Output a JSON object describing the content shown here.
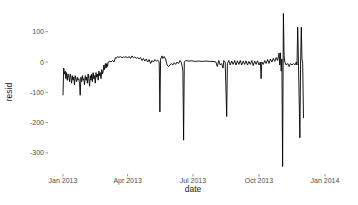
{
  "chart_data": {
    "type": "line",
    "title": "",
    "xlabel": "date",
    "ylabel": "resid",
    "ylim": [
      -350,
      170
    ],
    "xlim": [
      "2012-12-30",
      "2014-01-02"
    ],
    "grid": false,
    "legend": null,
    "x_ticks": [
      "Jan 2013",
      "Apr 2013",
      "Jul 2013",
      "Oct 2013",
      "Jan 2014"
    ],
    "y_ticks": [
      100,
      0,
      -100,
      -200,
      -300
    ],
    "line_color": "#000000",
    "series": [
      {
        "name": "resid",
        "points": [
          {
            "day": 1,
            "resid": -110
          },
          {
            "day": 2,
            "resid": -20
          },
          {
            "day": 3,
            "resid": -40
          },
          {
            "day": 4,
            "resid": -30
          },
          {
            "day": 5,
            "resid": -55
          },
          {
            "day": 6,
            "resid": -35
          },
          {
            "day": 7,
            "resid": -60
          },
          {
            "day": 8,
            "resid": -40
          },
          {
            "day": 9,
            "resid": -45
          },
          {
            "day": 10,
            "resid": -65
          },
          {
            "day": 11,
            "resid": -40
          },
          {
            "day": 12,
            "resid": -50
          },
          {
            "day": 13,
            "resid": -70
          },
          {
            "day": 14,
            "resid": -45
          },
          {
            "day": 15,
            "resid": -60
          },
          {
            "day": 16,
            "resid": -50
          },
          {
            "day": 17,
            "resid": -75
          },
          {
            "day": 18,
            "resid": -45
          },
          {
            "day": 19,
            "resid": -55
          },
          {
            "day": 20,
            "resid": -65
          },
          {
            "day": 21,
            "resid": -50
          },
          {
            "day": 22,
            "resid": -60
          },
          {
            "day": 23,
            "resid": -55
          },
          {
            "day": 24,
            "resid": -70
          },
          {
            "day": 25,
            "resid": -110
          },
          {
            "day": 26,
            "resid": -50
          },
          {
            "day": 27,
            "resid": -65
          },
          {
            "day": 28,
            "resid": -45
          },
          {
            "day": 29,
            "resid": -60
          },
          {
            "day": 30,
            "resid": -55
          },
          {
            "day": 31,
            "resid": -75
          },
          {
            "day": 32,
            "resid": -45
          },
          {
            "day": 33,
            "resid": -60
          },
          {
            "day": 34,
            "resid": -50
          },
          {
            "day": 35,
            "resid": -70
          },
          {
            "day": 36,
            "resid": -40
          },
          {
            "day": 37,
            "resid": -55
          },
          {
            "day": 38,
            "resid": -80
          },
          {
            "day": 39,
            "resid": -45
          },
          {
            "day": 40,
            "resid": -60
          },
          {
            "day": 41,
            "resid": -40
          },
          {
            "day": 42,
            "resid": -65
          },
          {
            "day": 43,
            "resid": -35
          },
          {
            "day": 44,
            "resid": -55
          },
          {
            "day": 45,
            "resid": -45
          },
          {
            "day": 46,
            "resid": -70
          },
          {
            "day": 47,
            "resid": -35
          },
          {
            "day": 48,
            "resid": -50
          },
          {
            "day": 49,
            "resid": -40
          },
          {
            "day": 50,
            "resid": -60
          },
          {
            "day": 51,
            "resid": -30
          },
          {
            "day": 52,
            "resid": -45
          },
          {
            "day": 53,
            "resid": -35
          },
          {
            "day": 54,
            "resid": -55
          },
          {
            "day": 55,
            "resid": -25
          },
          {
            "day": 56,
            "resid": -40
          },
          {
            "day": 57,
            "resid": -30
          },
          {
            "day": 58,
            "resid": -10
          },
          {
            "day": 59,
            "resid": -25
          },
          {
            "day": 60,
            "resid": -5
          },
          {
            "day": 61,
            "resid": -20
          },
          {
            "day": 62,
            "resid": -5
          },
          {
            "day": 63,
            "resid": -15
          },
          {
            "day": 64,
            "resid": 0
          },
          {
            "day": 66,
            "resid": 2
          },
          {
            "day": 68,
            "resid": 0
          },
          {
            "day": 70,
            "resid": 5
          },
          {
            "day": 72,
            "resid": 0
          },
          {
            "day": 74,
            "resid": 15
          },
          {
            "day": 75,
            "resid": 12
          },
          {
            "day": 77,
            "resid": 18
          },
          {
            "day": 79,
            "resid": 15
          },
          {
            "day": 81,
            "resid": 18
          },
          {
            "day": 83,
            "resid": 14
          },
          {
            "day": 85,
            "resid": 17
          },
          {
            "day": 87,
            "resid": 15
          },
          {
            "day": 89,
            "resid": 18
          },
          {
            "day": 91,
            "resid": 13
          },
          {
            "day": 93,
            "resid": 18
          },
          {
            "day": 95,
            "resid": 12
          },
          {
            "day": 97,
            "resid": 20
          },
          {
            "day": 99,
            "resid": 14
          },
          {
            "day": 101,
            "resid": 17
          },
          {
            "day": 103,
            "resid": 12
          },
          {
            "day": 105,
            "resid": 15
          },
          {
            "day": 107,
            "resid": 10
          },
          {
            "day": 109,
            "resid": 15
          },
          {
            "day": 111,
            "resid": 5
          },
          {
            "day": 113,
            "resid": 12
          },
          {
            "day": 115,
            "resid": 3
          },
          {
            "day": 117,
            "resid": 10
          },
          {
            "day": 119,
            "resid": 0
          },
          {
            "day": 121,
            "resid": 8
          },
          {
            "day": 123,
            "resid": -5
          },
          {
            "day": 125,
            "resid": 5
          },
          {
            "day": 127,
            "resid": 0
          },
          {
            "day": 129,
            "resid": 8
          },
          {
            "day": 131,
            "resid": 3
          },
          {
            "day": 133,
            "resid": 6
          },
          {
            "day": 135,
            "resid": 0
          },
          {
            "day": 136,
            "resid": -165
          },
          {
            "day": 137,
            "resid": 10
          },
          {
            "day": 139,
            "resid": 20
          },
          {
            "day": 140,
            "resid": 12
          },
          {
            "day": 142,
            "resid": 18
          },
          {
            "day": 144,
            "resid": 10
          },
          {
            "day": 146,
            "resid": -10
          },
          {
            "day": 148,
            "resid": -15
          },
          {
            "day": 150,
            "resid": -10
          },
          {
            "day": 152,
            "resid": -5
          },
          {
            "day": 154,
            "resid": -10
          },
          {
            "day": 156,
            "resid": -2
          },
          {
            "day": 158,
            "resid": -8
          },
          {
            "day": 160,
            "resid": 0
          },
          {
            "day": 162,
            "resid": -5
          },
          {
            "day": 164,
            "resid": 5
          },
          {
            "day": 166,
            "resid": -2
          },
          {
            "day": 167,
            "resid": -15
          },
          {
            "day": 168,
            "resid": -30
          },
          {
            "day": 169,
            "resid": -258
          },
          {
            "day": 170,
            "resid": 0
          },
          {
            "day": 172,
            "resid": 5
          },
          {
            "day": 176,
            "resid": 3
          },
          {
            "day": 180,
            "resid": 4
          },
          {
            "day": 185,
            "resid": 2
          },
          {
            "day": 190,
            "resid": 3
          },
          {
            "day": 195,
            "resid": 2
          },
          {
            "day": 200,
            "resid": 3
          },
          {
            "day": 205,
            "resid": 2
          },
          {
            "day": 210,
            "resid": 2
          },
          {
            "day": 214,
            "resid": 0
          },
          {
            "day": 216,
            "resid": -15
          },
          {
            "day": 218,
            "resid": 5
          },
          {
            "day": 220,
            "resid": -10
          },
          {
            "day": 222,
            "resid": -5
          },
          {
            "day": 224,
            "resid": -20
          },
          {
            "day": 225,
            "resid": 5
          },
          {
            "day": 227,
            "resid": 0
          },
          {
            "day": 229,
            "resid": -180
          },
          {
            "day": 230,
            "resid": -5
          },
          {
            "day": 232,
            "resid": 5
          },
          {
            "day": 234,
            "resid": -10
          },
          {
            "day": 236,
            "resid": 3
          },
          {
            "day": 238,
            "resid": -8
          },
          {
            "day": 240,
            "resid": 5
          },
          {
            "day": 242,
            "resid": -10
          },
          {
            "day": 244,
            "resid": 4
          },
          {
            "day": 246,
            "resid": -8
          },
          {
            "day": 248,
            "resid": 5
          },
          {
            "day": 250,
            "resid": -10
          },
          {
            "day": 252,
            "resid": 3
          },
          {
            "day": 254,
            "resid": -8
          },
          {
            "day": 256,
            "resid": 4
          },
          {
            "day": 258,
            "resid": -10
          },
          {
            "day": 260,
            "resid": 2
          },
          {
            "day": 262,
            "resid": -8
          },
          {
            "day": 264,
            "resid": 5
          },
          {
            "day": 266,
            "resid": -12
          },
          {
            "day": 268,
            "resid": 3
          },
          {
            "day": 270,
            "resid": -8
          },
          {
            "day": 272,
            "resid": 4
          },
          {
            "day": 274,
            "resid": -10
          },
          {
            "day": 276,
            "resid": 0
          },
          {
            "day": 277,
            "resid": -55
          },
          {
            "day": 278,
            "resid": 0
          },
          {
            "day": 280,
            "resid": -8
          },
          {
            "day": 282,
            "resid": 5
          },
          {
            "day": 284,
            "resid": -5
          },
          {
            "day": 286,
            "resid": 8
          },
          {
            "day": 288,
            "resid": -5
          },
          {
            "day": 290,
            "resid": 10
          },
          {
            "day": 292,
            "resid": 0
          },
          {
            "day": 294,
            "resid": 12
          },
          {
            "day": 296,
            "resid": 2
          },
          {
            "day": 298,
            "resid": 15
          },
          {
            "day": 300,
            "resid": 5
          },
          {
            "day": 302,
            "resid": 30
          },
          {
            "day": 303,
            "resid": -10
          },
          {
            "day": 304,
            "resid": 30
          },
          {
            "day": 305,
            "resid": -30
          },
          {
            "day": 306,
            "resid": 10
          },
          {
            "day": 307,
            "resid": -345
          },
          {
            "day": 308,
            "resid": 160
          },
          {
            "day": 309,
            "resid": 20
          },
          {
            "day": 310,
            "resid": 0
          },
          {
            "day": 312,
            "resid": -10
          },
          {
            "day": 314,
            "resid": -5
          },
          {
            "day": 316,
            "resid": -15
          },
          {
            "day": 318,
            "resid": -5
          },
          {
            "day": 320,
            "resid": -10
          },
          {
            "day": 322,
            "resid": -5
          },
          {
            "day": 324,
            "resid": -10
          },
          {
            "day": 326,
            "resid": 0
          },
          {
            "day": 327,
            "resid": -10
          },
          {
            "day": 328,
            "resid": 115
          },
          {
            "day": 329,
            "resid": 10
          },
          {
            "day": 331,
            "resid": -250
          },
          {
            "day": 332,
            "resid": 0
          },
          {
            "day": 333,
            "resid": 115
          },
          {
            "day": 334,
            "resid": 10
          },
          {
            "day": 335,
            "resid": -5
          },
          {
            "day": 336,
            "resid": -185
          }
        ]
      }
    ]
  }
}
